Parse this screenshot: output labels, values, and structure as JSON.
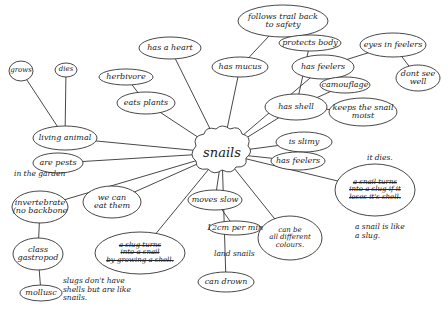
{
  "central": {
    "id": "snails",
    "text": "snails",
    "x": 222,
    "y": 153
  },
  "nodes": [
    {
      "id": "has-a-heart",
      "text": "has a heart",
      "x": 170,
      "y": 48,
      "w": 62,
      "h": 22
    },
    {
      "id": "has-mucus",
      "text": "has mucus",
      "x": 240,
      "y": 67,
      "w": 56,
      "h": 20
    },
    {
      "id": "follows-trail",
      "text": "follows trail back\nto safety",
      "x": 283,
      "y": 21,
      "w": 90,
      "h": 32
    },
    {
      "id": "protects-body",
      "text": "protects body",
      "x": 310,
      "y": 43,
      "w": 62,
      "h": 16
    },
    {
      "id": "has-feelers-top",
      "text": "has feelers",
      "x": 323,
      "y": 67,
      "w": 62,
      "h": 24
    },
    {
      "id": "eyes-in-feelers",
      "text": "eyes in feelers",
      "x": 393,
      "y": 45,
      "w": 66,
      "h": 24
    },
    {
      "id": "dont-see-well",
      "text": "dont see\nwell",
      "x": 418,
      "y": 78,
      "w": 44,
      "h": 26
    },
    {
      "id": "has-shell",
      "text": "has shell",
      "x": 296,
      "y": 107,
      "w": 62,
      "h": 26
    },
    {
      "id": "camouflage",
      "text": "camouflage",
      "x": 345,
      "y": 85,
      "w": 50,
      "h": 16
    },
    {
      "id": "keeps-moist",
      "text": "keeps the snail\nmoist",
      "x": 363,
      "y": 112,
      "w": 68,
      "h": 28
    },
    {
      "id": "is-slimy",
      "text": "is slimy",
      "x": 304,
      "y": 142,
      "w": 56,
      "h": 20
    },
    {
      "id": "has-feelers-2",
      "text": "has feelers",
      "x": 298,
      "y": 161,
      "w": 54,
      "h": 18
    },
    {
      "id": "snail-turns-slug",
      "text": "a snail turns\ninto a slug if it\nloses it's shell.",
      "x": 375,
      "y": 190,
      "w": 80,
      "h": 52,
      "struck": true
    },
    {
      "id": "can-be-colours",
      "text": "can be\nall different\ncolours.",
      "x": 290,
      "y": 238,
      "w": 64,
      "h": 44
    },
    {
      "id": "moves-slow",
      "text": "moves slow",
      "x": 215,
      "y": 200,
      "w": 54,
      "h": 20
    },
    {
      "id": "12cm-per-min",
      "text": "12cm per min",
      "x": 235,
      "y": 228,
      "w": 52,
      "h": 14
    },
    {
      "id": "can-drown",
      "text": "can drown",
      "x": 226,
      "y": 282,
      "w": 56,
      "h": 20
    },
    {
      "id": "slug-turns-snail",
      "text": "a slug turns\ninto a snail\nby growing a shell.",
      "x": 140,
      "y": 253,
      "w": 90,
      "h": 42,
      "struck": true
    },
    {
      "id": "we-can-eat-them",
      "text": "we can\neat them",
      "x": 112,
      "y": 202,
      "w": 58,
      "h": 32
    },
    {
      "id": "are-pests",
      "text": "are pests",
      "x": 58,
      "y": 163,
      "w": 50,
      "h": 20
    },
    {
      "id": "invertebrate",
      "text": "invertebrate\n(no backbone",
      "x": 40,
      "y": 207,
      "w": 56,
      "h": 32
    },
    {
      "id": "class-gastropod",
      "text": "class\ngastropod",
      "x": 38,
      "y": 254,
      "w": 50,
      "h": 32
    },
    {
      "id": "mollusc",
      "text": "mollusc",
      "x": 41,
      "y": 293,
      "w": 42,
      "h": 16
    },
    {
      "id": "living-animal",
      "text": "living animal",
      "x": 65,
      "y": 138,
      "w": 64,
      "h": 24
    },
    {
      "id": "grows",
      "text": "grows",
      "x": 21,
      "y": 71,
      "w": 24,
      "h": 20
    },
    {
      "id": "dies",
      "text": "dies",
      "x": 66,
      "y": 70,
      "w": 22,
      "h": 14
    },
    {
      "id": "herbivore",
      "text": "herbivore",
      "x": 126,
      "y": 77,
      "w": 54,
      "h": 16
    },
    {
      "id": "eats-plants",
      "text": "eats plants",
      "x": 146,
      "y": 103,
      "w": 58,
      "h": 22
    }
  ],
  "edges": [
    [
      "snails",
      "has-a-heart"
    ],
    [
      "snails",
      "has-mucus"
    ],
    [
      "snails",
      "has-feelers-top"
    ],
    [
      "snails",
      "has-shell"
    ],
    [
      "snails",
      "is-slimy"
    ],
    [
      "snails",
      "has-feelers-2"
    ],
    [
      "snails",
      "snail-turns-slug"
    ],
    [
      "snails",
      "can-be-colours"
    ],
    [
      "snails",
      "moves-slow"
    ],
    [
      "snails",
      "can-drown"
    ],
    [
      "snails",
      "slug-turns-snail"
    ],
    [
      "snails",
      "we-can-eat-them"
    ],
    [
      "snails",
      "are-pests"
    ],
    [
      "snails",
      "invertebrate"
    ],
    [
      "snails",
      "living-animal"
    ],
    [
      "snails",
      "eats-plants"
    ],
    [
      "has-mucus",
      "follows-trail"
    ],
    [
      "has-feelers-top",
      "eyes-in-feelers"
    ],
    [
      "eyes-in-feelers",
      "dont-see-well"
    ],
    [
      "has-shell",
      "protects-body"
    ],
    [
      "has-shell",
      "camouflage"
    ],
    [
      "has-shell",
      "keeps-moist"
    ],
    [
      "moves-slow",
      "12cm-per-min"
    ],
    [
      "invertebrate",
      "class-gastropod"
    ],
    [
      "class-gastropod",
      "mollusc"
    ],
    [
      "living-animal",
      "grows"
    ],
    [
      "living-animal",
      "dies"
    ],
    [
      "eats-plants",
      "herbivore"
    ]
  ],
  "annotations": [
    {
      "id": "in-the-garden",
      "text": "in the garden",
      "x": 14,
      "y": 176
    },
    {
      "id": "it-dies",
      "text": "it dies.",
      "x": 367,
      "y": 160
    },
    {
      "id": "snail-like-slug",
      "text": "a snail is like\na slug.",
      "x": 355,
      "y": 229
    },
    {
      "id": "land-snails",
      "text": "land snails",
      "x": 214,
      "y": 256
    },
    {
      "id": "slugs-no-shells",
      "text": "slugs don't have\nshells but are like\nsnails.",
      "x": 63,
      "y": 283
    }
  ]
}
